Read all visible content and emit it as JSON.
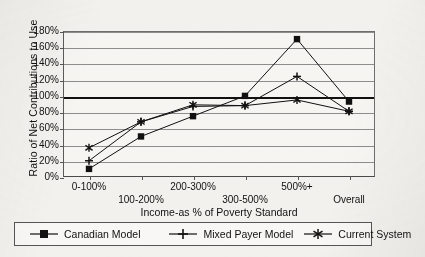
{
  "chart_data": {
    "type": "line",
    "title": "",
    "xlabel": "Income-as % of Poverty Standard",
    "ylabel": "Ratio of Net Contributions to Use",
    "categories": [
      "0-100%",
      "100-200%",
      "200-300%",
      "300-500%",
      "500%+",
      "Overall"
    ],
    "ylim": [
      0,
      180
    ],
    "ytick_step": 20,
    "ytick_labels": [
      "0%",
      "20%",
      "40%",
      "60%",
      "80%",
      "100%",
      "120%",
      "140%",
      "160%",
      "180%"
    ],
    "ytick_values": [
      0,
      20,
      40,
      60,
      80,
      100,
      120,
      140,
      160,
      180
    ],
    "grid": true,
    "reference_line": 100,
    "legend_position": "bottom",
    "series": [
      {
        "name": "Canadian Model",
        "marker": "square",
        "values": [
          10,
          50,
          75,
          100,
          170,
          93
        ]
      },
      {
        "name": "Mixed Payer Model",
        "marker": "plus",
        "values": [
          20,
          68,
          87,
          88,
          124,
          81
        ]
      },
      {
        "name": "Current System",
        "marker": "asterisk",
        "values": [
          36,
          68,
          89,
          88,
          95,
          81
        ]
      }
    ]
  },
  "axis": {
    "y_title": "Ratio of Net Contributions to Use",
    "x_title": "Income-as % of Poverty Standard"
  },
  "legend": {
    "items": [
      {
        "label": "Canadian Model",
        "marker": "square-marker-icon"
      },
      {
        "label": "Mixed Payer Model",
        "marker": "plus-marker-icon"
      },
      {
        "label": "Current System",
        "marker": "asterisk-marker-icon"
      }
    ]
  },
  "colors": {
    "ink": "#111111",
    "grid": "#8d8d8d",
    "axis": "#4a4a4a",
    "paper": "#f2f1ed"
  }
}
